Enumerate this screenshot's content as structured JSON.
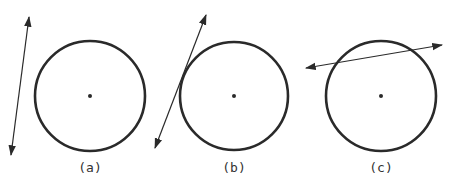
{
  "figure": {
    "stroke_color": "#2a2a2a",
    "panels": [
      {
        "label": "(a)",
        "relation": "non-intersecting line",
        "circle": {
          "cx": 90,
          "cy": 96,
          "r": 55
        },
        "line": {
          "x1": 29,
          "y1": 17,
          "x2": 11,
          "y2": 155
        }
      },
      {
        "label": "(b)",
        "relation": "tangent line",
        "circle": {
          "cx": 234,
          "cy": 96,
          "r": 54
        },
        "line": {
          "x1": 206,
          "y1": 15,
          "x2": 155,
          "y2": 148
        }
      },
      {
        "label": "(c)",
        "relation": "secant line",
        "circle": {
          "cx": 381,
          "cy": 96,
          "r": 55
        },
        "line": {
          "x1": 306,
          "y1": 68,
          "x2": 442,
          "y2": 45
        }
      }
    ]
  }
}
